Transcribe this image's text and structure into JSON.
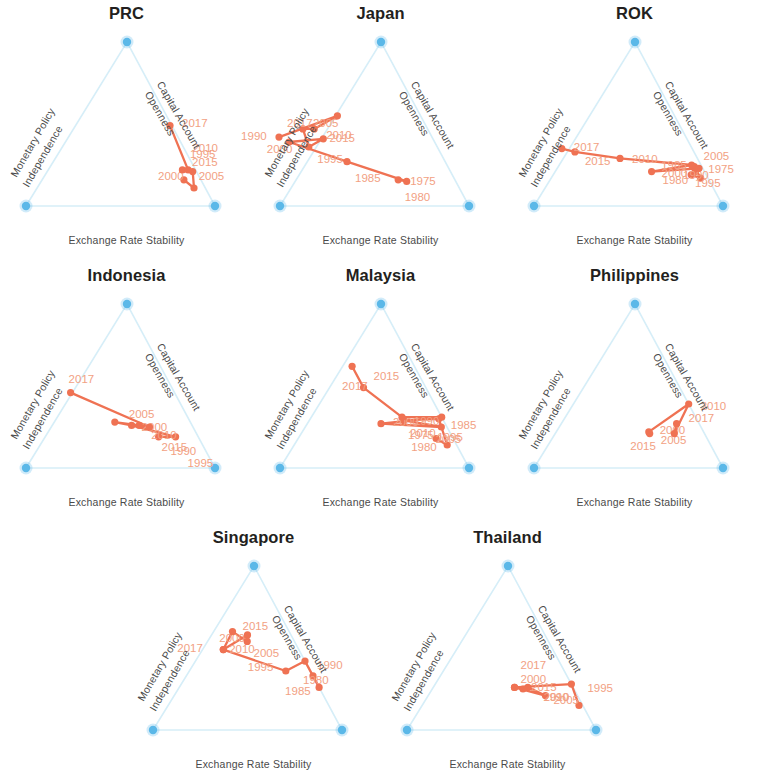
{
  "figure": {
    "axis_labels": {
      "left": "Monetary Policy\nIndependence",
      "left_line1": "Monetary Policy",
      "left_line2": "Independence",
      "right_line1": "Capital Account",
      "right_line2": "Openness",
      "bottom": "Exchange Rate Stability"
    },
    "colors": {
      "trajectory": "#ef7253",
      "year_label": "#f2a183",
      "vertex": "#5bb8e8",
      "edge": "#d6eef8",
      "title": "#231f20",
      "axis_text": "#4a4a4a",
      "background": "#ffffff"
    }
  },
  "chart_data": {
    "type": "scatter",
    "subtitle": "Ternary (trilemma triangle) diagrams: each vertex is a full corner solution",
    "axes": {
      "bottom": "Exchange Rate Stability",
      "left": "Monetary Policy Independence",
      "right": "Capital Account Openness"
    },
    "axis_ranges": {
      "each_axis": [
        0,
        1
      ]
    },
    "grid": false,
    "legend": "none",
    "note": "Coordinates are ternary barycentric fractions (ers, mpi, kao) summing to 1, read off each panel.",
    "panels": [
      {
        "name": "PRC",
        "points": [
          {
            "year": "1995",
            "ers": 0.16,
            "mpi": 0.09,
            "kao": 0.75,
            "label_dx": 6,
            "label_dy": -26
          },
          {
            "year": "2000",
            "ers": 0.11,
            "mpi": 0.06,
            "kao": 0.83,
            "label_dx": -36,
            "label_dy": -12
          },
          {
            "year": "2005",
            "ers": 0.21,
            "mpi": 0.02,
            "kao": 0.77,
            "label_dx": 6,
            "label_dy": 4
          },
          {
            "year": "2010",
            "ers": 0.22,
            "mpi": 0.07,
            "kao": 0.71,
            "label_dx": 10,
            "label_dy": -22
          },
          {
            "year": "2015",
            "ers": 0.22,
            "mpi": 0.04,
            "kao": 0.74,
            "label_dx": 4,
            "label_dy": -8
          },
          {
            "year": "2017",
            "ers": 0.49,
            "mpi": 0.01,
            "kao": 0.5,
            "label_dx": 12,
            "label_dy": -3
          }
        ]
      },
      {
        "name": "Japan",
        "points": [
          {
            "year": "1975",
            "ers": 0.16,
            "mpi": 0.3,
            "kao": 0.54,
            "label_dx": 12,
            "label_dy": 1
          },
          {
            "year": "1980",
            "ers": 0.15,
            "mpi": 0.26,
            "kao": 0.59,
            "label_dx": -2,
            "label_dy": 16
          },
          {
            "year": "1985",
            "ers": 0.27,
            "mpi": 0.52,
            "kao": 0.21,
            "label_dx": 8,
            "label_dy": 16
          },
          {
            "year": "1990",
            "ers": 0.39,
            "mpi": 0.77,
            "kao": -0.16,
            "label_dx": -48,
            "label_dy": -6
          },
          {
            "year": "1995",
            "ers": 0.41,
            "mpi": 0.58,
            "kao": 0.01,
            "label_dx": -6,
            "label_dy": 20
          },
          {
            "year": "2000",
            "ers": 0.36,
            "mpi": 0.68,
            "kao": -0.04,
            "label_dx": -42,
            "label_dy": 2
          },
          {
            "year": "2005",
            "ers": 0.47,
            "mpi": 0.66,
            "kao": -0.13,
            "label_dx": 10,
            "label_dy": -6
          },
          {
            "year": "2010",
            "ers": 0.47,
            "mpi": 0.6,
            "kao": -0.07,
            "label_dx": 12,
            "label_dy": 6
          },
          {
            "year": "2015",
            "ers": 0.55,
            "mpi": 0.44,
            "kao": 0.01,
            "label_dx": -8,
            "label_dy": 22
          },
          {
            "year": "2017",
            "ers": 0.42,
            "mpi": 0.81,
            "kao": -0.23,
            "label_dx": 8,
            "label_dy": -14
          }
        ]
      },
      {
        "name": "ROK",
        "points": [
          {
            "year": "1975",
            "ers": 0.24,
            "mpi": 0.04,
            "kao": 0.72,
            "label_dx": 14,
            "label_dy": 2
          },
          {
            "year": "1980",
            "ers": 0.17,
            "mpi": 0.04,
            "kao": 0.79,
            "label_dx": -38,
            "label_dy": 2
          },
          {
            "year": "1985",
            "ers": 0.19,
            "mpi": 0.08,
            "kao": 0.73,
            "label_dx": -30,
            "label_dy": -10
          },
          {
            "year": "1990",
            "ers": 0.21,
            "mpi": 0.05,
            "kao": 0.74,
            "label_dx": -12,
            "label_dy": 3
          },
          {
            "year": "1995",
            "ers": 0.23,
            "mpi": 0.02,
            "kao": 0.75,
            "label_dx": -4,
            "label_dy": 15
          },
          {
            "year": "2000",
            "ers": 0.21,
            "mpi": 0.28,
            "kao": 0.51,
            "label_dx": 10,
            "label_dy": 1
          },
          {
            "year": "2005",
            "ers": 0.25,
            "mpi": 0.05,
            "kao": 0.7,
            "label_dx": 12,
            "label_dy": -9
          },
          {
            "year": "2010",
            "ers": 0.29,
            "mpi": 0.41,
            "kao": 0.3,
            "label_dx": 12,
            "label_dy": 1
          },
          {
            "year": "2015",
            "ers": 0.33,
            "mpi": 0.63,
            "kao": 0.04,
            "label_dx": 10,
            "label_dy": 9
          },
          {
            "year": "2017",
            "ers": 0.35,
            "mpi": 0.69,
            "kao": -0.04,
            "label_dx": 12,
            "label_dy": -2
          }
        ]
      },
      {
        "name": "Indonesia",
        "points": [
          {
            "year": "1990",
            "ers": 0.19,
            "mpi": 0.21,
            "kao": 0.6,
            "label_dx": 12,
            "label_dy": 14
          },
          {
            "year": "1995",
            "ers": 0.19,
            "mpi": 0.12,
            "kao": 0.69,
            "label_dx": 12,
            "label_dy": 26
          },
          {
            "year": "2000",
            "ers": 0.26,
            "mpi": 0.32,
            "kao": 0.42,
            "label_dx": 10,
            "label_dy": 2
          },
          {
            "year": "2005",
            "ers": 0.28,
            "mpi": 0.4,
            "kao": 0.32,
            "label_dx": 14,
            "label_dy": -8
          },
          {
            "year": "2010",
            "ers": 0.26,
            "mpi": 0.28,
            "kao": 0.46,
            "label_dx": 12,
            "label_dy": 10
          },
          {
            "year": "2015",
            "ers": 0.25,
            "mpi": 0.23,
            "kao": 0.52,
            "label_dx": 12,
            "label_dy": 20
          },
          {
            "year": "2017",
            "ers": 0.46,
            "mpi": 0.55,
            "kao": -0.01,
            "label_dx": -2,
            "label_dy": -14
          }
        ]
      },
      {
        "name": "Malaysia",
        "points": [
          {
            "year": "1975",
            "ers": 0.18,
            "mpi": 0.09,
            "kao": 0.73,
            "label_dx": -28,
            "label_dy": -4
          },
          {
            "year": "1980",
            "ers": 0.14,
            "mpi": 0.05,
            "kao": 0.81,
            "label_dx": -36,
            "label_dy": 2
          },
          {
            "year": "1985",
            "ers": 0.3,
            "mpi": 0.02,
            "kao": 0.68,
            "label_dx": 12,
            "label_dy": 6
          },
          {
            "year": "1990",
            "ers": 0.29,
            "mpi": 0.21,
            "kao": 0.5,
            "label_dx": 10,
            "label_dy": 1
          },
          {
            "year": "1995",
            "ers": 0.25,
            "mpi": 0.03,
            "kao": 0.72,
            "label_dx": -4,
            "label_dy": 10
          },
          {
            "year": "2000",
            "ers": 0.27,
            "mpi": 0.34,
            "kao": 0.39,
            "label_dx": 12,
            "label_dy": -2
          },
          {
            "year": "2005",
            "ers": 0.31,
            "mpi": 0.0,
            "kao": 0.69,
            "label_dx": -6,
            "label_dy": 22
          },
          {
            "year": "2010",
            "ers": 0.31,
            "mpi": 0.21,
            "kao": 0.48,
            "label_dx": 8,
            "label_dy": 16
          },
          {
            "year": "2015",
            "ers": 0.49,
            "mpi": 0.33,
            "kao": 0.18,
            "label_dx": 10,
            "label_dy": -12
          },
          {
            "year": "2017",
            "ers": 0.62,
            "mpi": 0.33,
            "kao": 0.05,
            "label_dx": -10,
            "label_dy": 20
          }
        ]
      },
      {
        "name": "Philippines",
        "points": [
          {
            "year": "2000",
            "ers": 0.21,
            "mpi": 0.29,
            "kao": 0.5,
            "label_dx": 10,
            "label_dy": -4
          },
          {
            "year": "2005",
            "ers": 0.22,
            "mpi": 0.29,
            "kao": 0.49,
            "label_dx": 12,
            "label_dy": 8
          },
          {
            "year": "2010",
            "ers": 0.39,
            "mpi": 0.0,
            "kao": 0.61,
            "label_dx": 12,
            "label_dy": 2
          },
          {
            "year": "2015",
            "ers": 0.21,
            "mpi": 0.16,
            "kao": 0.63,
            "label_dx": -44,
            "label_dy": 12
          },
          {
            "year": "2017",
            "ers": 0.27,
            "mpi": 0.12,
            "kao": 0.61,
            "label_dx": 12,
            "label_dy": -6
          }
        ]
      },
      {
        "name": "Singapore",
        "points": [
          {
            "year": "1980",
            "ers": 0.33,
            "mpi": 0.0,
            "kao": 0.67,
            "label_dx": -10,
            "label_dy": 4
          },
          {
            "year": "1985",
            "ers": 0.26,
            "mpi": 0.0,
            "kao": 0.74,
            "label_dx": -34,
            "label_dy": 4
          },
          {
            "year": "1990",
            "ers": 0.42,
            "mpi": 0.0,
            "kao": 0.58,
            "label_dx": 12,
            "label_dy": 4
          },
          {
            "year": "1995",
            "ers": 0.36,
            "mpi": 0.13,
            "kao": 0.51,
            "label_dx": -38,
            "label_dy": -4
          },
          {
            "year": "2000",
            "ers": 0.49,
            "mpi": 0.4,
            "kao": 0.11,
            "label_dx": -4,
            "label_dy": -12
          },
          {
            "year": "2005",
            "ers": 0.58,
            "mpi": 0.23,
            "kao": 0.19,
            "label_dx": 6,
            "label_dy": 18
          },
          {
            "year": "2010",
            "ers": 0.54,
            "mpi": 0.25,
            "kao": 0.21,
            "label_dx": -18,
            "label_dy": 8
          },
          {
            "year": "2015",
            "ers": 0.6,
            "mpi": 0.3,
            "kao": 0.1,
            "label_dx": 10,
            "label_dy": -6
          },
          {
            "year": "2017",
            "ers": 0.49,
            "mpi": 0.4,
            "kao": 0.11,
            "label_dx": -46,
            "label_dy": -2
          }
        ]
      },
      {
        "name": "Thailand",
        "points": [
          {
            "year": "1990",
            "ers": 0.15,
            "mpi": 0.02,
            "kao": 0.83,
            "label_dx": -36,
            "label_dy": -8
          },
          {
            "year": "1995",
            "ers": 0.28,
            "mpi": 0.0,
            "kao": 0.72,
            "label_dx": 16,
            "label_dy": 4
          },
          {
            "year": "2000",
            "ers": 0.26,
            "mpi": 0.31,
            "kao": 0.43,
            "label_dx": 6,
            "label_dy": -8
          },
          {
            "year": "2005",
            "ers": 0.21,
            "mpi": 0.17,
            "kao": 0.62,
            "label_dx": 8,
            "label_dy": 4
          },
          {
            "year": "2010",
            "ers": 0.26,
            "mpi": 0.24,
            "kao": 0.5,
            "label_dx": 16,
            "label_dy": 10
          },
          {
            "year": "2015",
            "ers": 0.25,
            "mpi": 0.27,
            "kao": 0.48,
            "label_dx": 8,
            "label_dy": -2
          },
          {
            "year": "2017",
            "ers": 0.26,
            "mpi": 0.31,
            "kao": 0.43,
            "label_dx": 6,
            "label_dy": -22
          }
        ]
      }
    ]
  }
}
